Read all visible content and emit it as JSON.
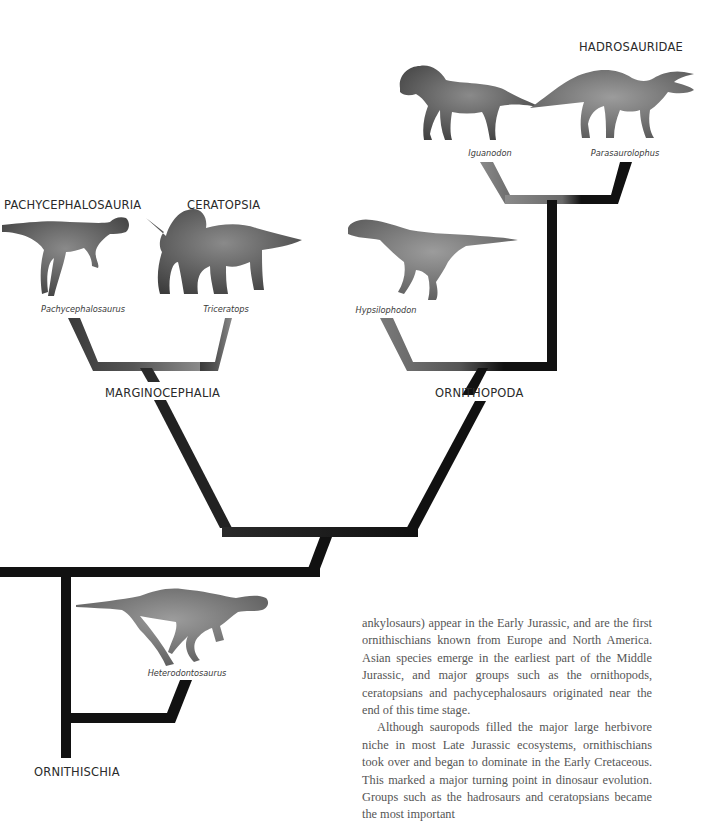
{
  "clades": {
    "hadrosauridae": "HADROSAURIDAE",
    "pachycephalosauria": "PACHYCEPHALOSAURIA",
    "ceratopsia": "CERATOPSIA",
    "marginocephalia": "MARGINOCEPHALIA",
    "ornithopoda": "ORNITHOPODA",
    "ornithischia": "ORNITHISCHIA"
  },
  "species": {
    "iguanodon": "Iguanodon",
    "parasaurolophus": "Parasaurolophus",
    "pachycephalosaurus": "Pachycephalosaurus",
    "triceratops": "Triceratops",
    "hypsilophodon": "Hypsilophodon",
    "heterodontosaurus": "Heterodontosaurus"
  },
  "body_text": {
    "paragraph_1": "ankylosaurs) appear in the Early Jurassic, and are the first ornithischians known from Europe and North America. Asian species emerge in the earliest part of the Middle Jurassic, and major groups such as the ornithopods, ceratopsians and pachycephalosaurs originated near the end of this time stage.",
    "paragraph_2": "Although sauropods filled the major large herbivore niche in most Late Jurassic ecosystems, ornithischians took over and began to dominate in the Early Cretaceous. This marked a major turning point in dinosaur evolution. Groups such as the hadrosaurs and ceratopsians became the most important"
  },
  "colors": {
    "branch_dark": "#111111",
    "branch_grey": "#7a7a7a",
    "label_text": "#2a2a2a",
    "body_text": "#555555"
  }
}
